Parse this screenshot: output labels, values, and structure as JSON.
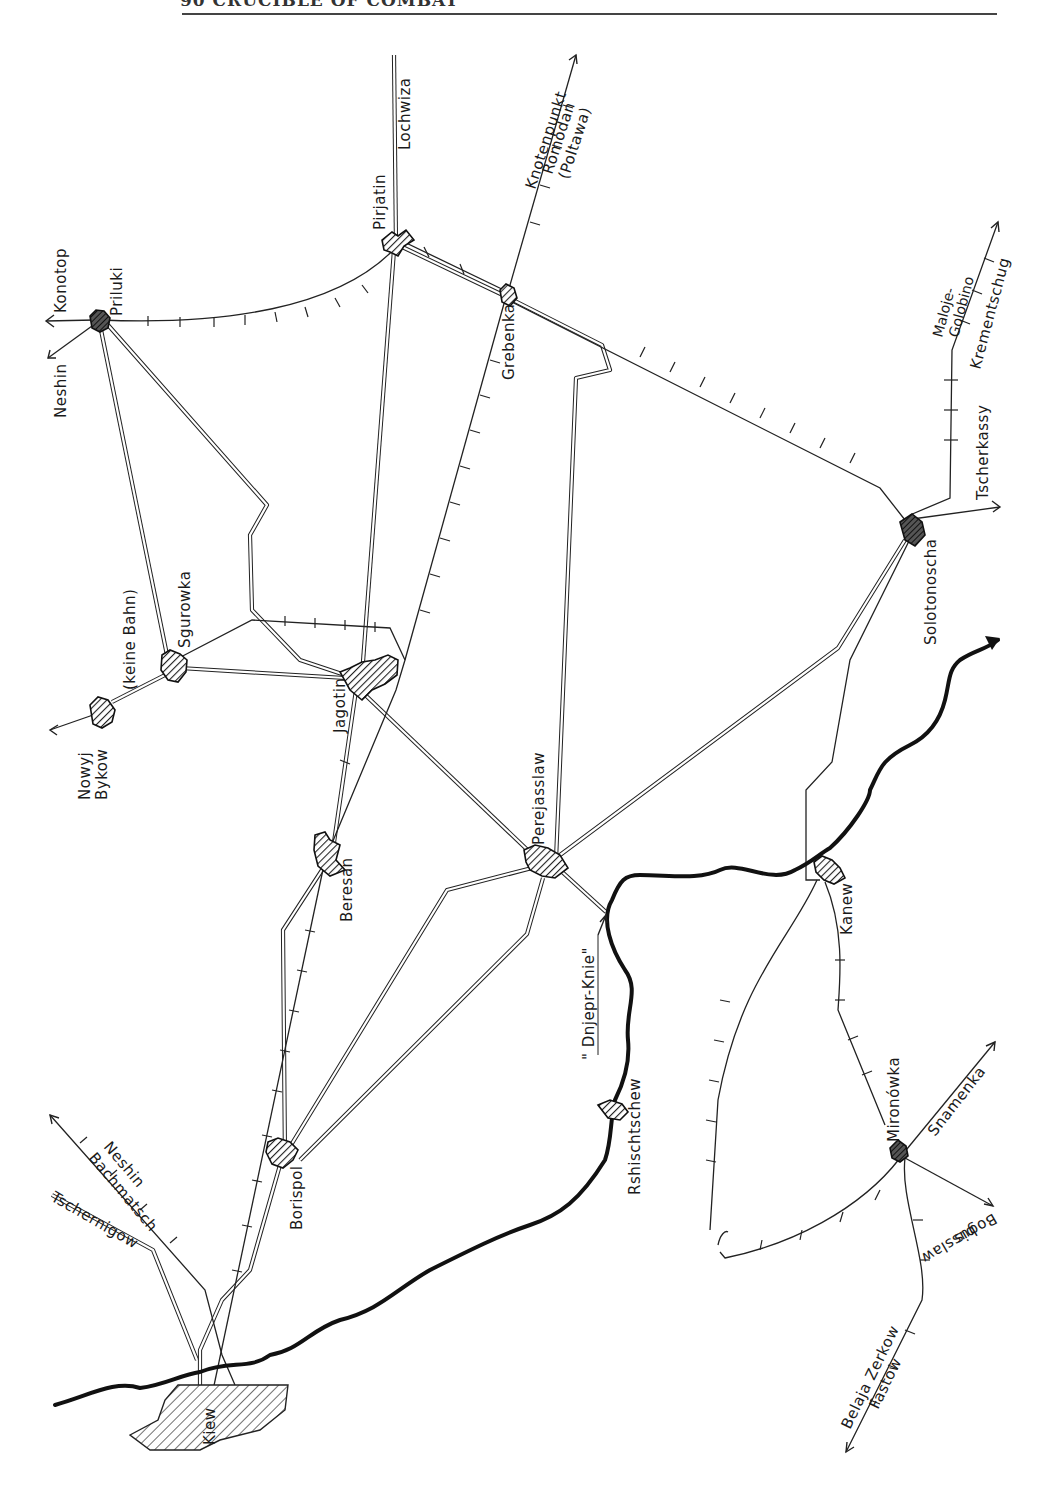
{
  "page": {
    "header_text": "90 CRUCIBLE OF COMBAT"
  },
  "map": {
    "orientation": "rotated 90° counter-clockwise (north to the left)",
    "legend_styles": {
      "railway": "single line with cross ticks",
      "road": "double line",
      "river": "thick black line (Dnieper)",
      "town": "hatched shape"
    },
    "towns": {
      "priluki": "Priluki",
      "pirjatin": "Pirjatin",
      "grebenka": "Grebenka",
      "sgurowka": "Sgurowka",
      "nowyj_bykow_1": "Nowyj",
      "nowyj_bykow_2": "Bykow",
      "keine_bahn": "(keine Bahn)",
      "jagotin": "Jagotin",
      "beresan": "Beresan",
      "perejasslaw": "Perejasslaw",
      "solotonoscha": "Solotonoscha",
      "kanew": "Kanew",
      "borispol": "Borispol",
      "rshischtschew": "Rshischtschew",
      "kiew": "Kiew",
      "mironowka": "Mironówka"
    },
    "destinations": {
      "konotop": "Konotop",
      "neshin_north": "Neshin",
      "lochwiza": "Lochwiza",
      "knotenpunkt": "Knotenpunkt",
      "romodan": "Romodan",
      "poltawa": "(Poltawa)",
      "maloje": "Maloje-",
      "golobino": "Golobino",
      "krementschug": "Krementschug",
      "tscherkassy": "Tscherkassy",
      "bachmatsch": "Bachmatsch",
      "neshin_south": "Neshin",
      "tschernigow": "Tschernigow",
      "snamenka": "Snamenka",
      "bis": "bis",
      "bogusslaw": "Bogusslaw",
      "belaja_zerkow": "Belaja Zerkow",
      "fastow": "Fastow"
    },
    "annotations": {
      "dnjepr_knie": "\" Dnjepr-Knie\""
    }
  }
}
